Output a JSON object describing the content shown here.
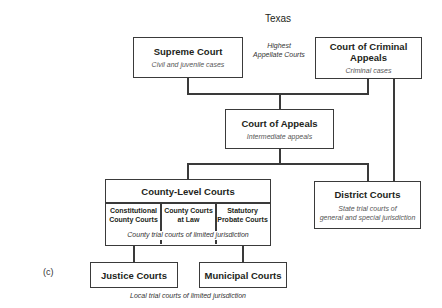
{
  "diagram": {
    "title": "Texas",
    "panel_label": "(c)",
    "highest_note": {
      "line1": "Highest",
      "line2": "Appellate Courts"
    },
    "supreme_court": {
      "title": "Supreme Court",
      "subtitle": "Civil and juvenile cases"
    },
    "criminal_appeals": {
      "title": "Court of Criminal Appeals",
      "subtitle": "Criminal cases"
    },
    "court_of_appeals": {
      "title": "Court of Appeals",
      "subtitle": "Intermediate appeals"
    },
    "county_level": {
      "title": "County-Level Courts",
      "columns": [
        {
          "line1": "Constitutional",
          "line2": "County Courts"
        },
        {
          "line1": "County Courts",
          "line2": "at Law"
        },
        {
          "line1": "Statutory",
          "line2": "Probate Courts"
        }
      ],
      "caption": "County trial courts of limited jurisdiction"
    },
    "district_courts": {
      "title": "District Courts",
      "subtitle_line1": "State trial courts of",
      "subtitle_line2": "general and special jurisdiction"
    },
    "justice_courts": {
      "title": "Justice Courts"
    },
    "municipal_courts": {
      "title": "Municipal Courts"
    },
    "local_caption": "Local trial courts of limited jurisdiction"
  }
}
